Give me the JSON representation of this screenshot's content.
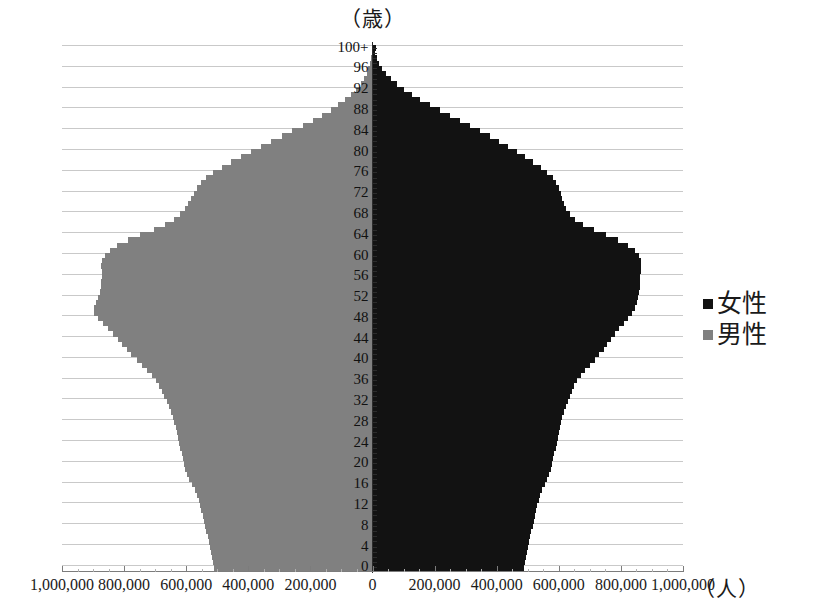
{
  "chart_data": {
    "type": "bar",
    "subtype": "population-pyramid",
    "title": "（歳）",
    "xlabel": "（人）",
    "ylabel": "（歳）",
    "orientation": "horizontal",
    "grid": true,
    "legend_position": "right",
    "xlim": [
      -1000000,
      1000000
    ],
    "ylim": [
      0,
      100
    ],
    "x_tick_labels": [
      "1,000,000",
      "800,000",
      "600,000",
      "400,000",
      "200,000",
      "0",
      "200,000",
      "400,000",
      "600,000",
      "800,000",
      "1,000,000"
    ],
    "x_tick_values": [
      -1000000,
      -800000,
      -600000,
      -400000,
      -200000,
      0,
      200000,
      400000,
      600000,
      800000,
      1000000
    ],
    "y_tick_labels": [
      "0",
      "4",
      "8",
      "12",
      "16",
      "20",
      "24",
      "28",
      "32",
      "36",
      "40",
      "44",
      "48",
      "52",
      "56",
      "60",
      "64",
      "68",
      "72",
      "76",
      "80",
      "84",
      "88",
      "92",
      "96",
      "100+"
    ],
    "y_tick_values": [
      0,
      4,
      8,
      12,
      16,
      20,
      24,
      28,
      32,
      36,
      40,
      44,
      48,
      52,
      56,
      60,
      64,
      68,
      72,
      76,
      80,
      84,
      88,
      92,
      96,
      100
    ],
    "colors": {
      "female": "#121212",
      "male": "#808080"
    },
    "series": [
      {
        "name": "女性",
        "side": "right",
        "color": "#121212",
        "values": [
          489000,
          492000,
          495000,
          498000,
          501000,
          505000,
          508000,
          512000,
          516000,
          520000,
          524000,
          528000,
          531000,
          535000,
          540000,
          547000,
          556000,
          563000,
          570000,
          575000,
          579000,
          582000,
          586000,
          590000,
          594000,
          598000,
          601000,
          604000,
          607000,
          611000,
          616000,
          622000,
          629000,
          636000,
          642000,
          650000,
          660000,
          672000,
          685000,
          700000,
          716000,
          731000,
          744000,
          756000,
          768000,
          781000,
          795000,
          810000,
          824000,
          836000,
          845000,
          851000,
          855000,
          858000,
          860000,
          862000,
          863000,
          865000,
          866000,
          864000,
          858000,
          845000,
          822000,
          790000,
          752000,
          712000,
          678000,
          653000,
          636000,
          624000,
          616000,
          611000,
          606000,
          600000,
          592000,
          580000,
          563000,
          542000,
          518000,
          492000,
          465000,
          437000,
          408000,
          378000,
          347000,
          315000,
          282000,
          249000,
          216000,
          184000,
          154000,
          127000,
          102000,
          80000,
          61000,
          45000,
          32000,
          22000,
          14000,
          8500,
          11000
        ],
        "peak_value": 866000,
        "peak_age": 58
      },
      {
        "name": "男性",
        "side": "left",
        "color": "#808080",
        "values": [
          511000,
          514000,
          517000,
          521000,
          524000,
          528000,
          531000,
          535000,
          539000,
          543000,
          547000,
          551000,
          555000,
          559000,
          564000,
          572000,
          582000,
          590000,
          597000,
          603000,
          607000,
          611000,
          615000,
          619000,
          623000,
          627000,
          631000,
          634000,
          638000,
          642000,
          648000,
          655000,
          663000,
          671000,
          678000,
          687000,
          698000,
          711000,
          726000,
          743000,
          760000,
          777000,
          792000,
          806000,
          820000,
          835000,
          851000,
          868000,
          884000,
          896000,
          897000,
          891000,
          884000,
          879000,
          875000,
          873000,
          871000,
          872000,
          873000,
          870000,
          862000,
          847000,
          822000,
          788000,
          748000,
          705000,
          668000,
          640000,
          620000,
          605000,
          594000,
          585000,
          576000,
          566000,
          553000,
          536000,
          513000,
          486000,
          456000,
          424000,
          392000,
          359000,
          326000,
          292000,
          258000,
          225000,
          193000,
          163000,
          135000,
          110000,
          87000,
          68000,
          52000,
          38000,
          27000,
          19000,
          13000,
          8000,
          5000,
          2800,
          3200
        ],
        "peak_value": 897000,
        "peak_age": 50
      }
    ]
  },
  "legend": {
    "items": [
      {
        "label": "女性",
        "color": "#121212"
      },
      {
        "label": "男性",
        "color": "#808080"
      }
    ]
  }
}
